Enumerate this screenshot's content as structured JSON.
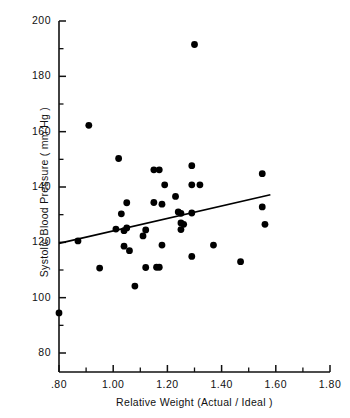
{
  "chart_data": {
    "type": "scatter",
    "title": "",
    "xlabel": "Relative Weight (Actual / Ideal )",
    "ylabel": "Systolic Blood Pressure ( mm Hg )",
    "xlim": [
      0.8,
      1.8
    ],
    "ylim": [
      75,
      200
    ],
    "grid": false,
    "legend": null,
    "x_major_ticks": [
      0.8,
      1.0,
      1.2,
      1.4,
      1.6,
      1.8
    ],
    "x_tick_labels": [
      ".80",
      "1.00",
      "1.20",
      "1.40",
      "1.60",
      "1.80"
    ],
    "x_minor_ticks": [
      0.9,
      1.1,
      1.3,
      1.5,
      1.7
    ],
    "y_major_ticks": [
      80,
      100,
      120,
      140,
      160,
      180,
      200
    ],
    "y_tick_labels": [
      "80",
      "100",
      "120",
      "140",
      "160",
      "180",
      "200"
    ],
    "y_minor_ticks": [
      90,
      110,
      130,
      150,
      170,
      190
    ],
    "marker": "filled-circle",
    "marker_color": "#000000",
    "marker_size": 3.4,
    "points": [
      {
        "x": 0.8,
        "y": 94.5
      },
      {
        "x": 0.87,
        "y": 120.5
      },
      {
        "x": 0.91,
        "y": 162.3
      },
      {
        "x": 0.95,
        "y": 110.7
      },
      {
        "x": 1.01,
        "y": 124.8
      },
      {
        "x": 1.02,
        "y": 150.3
      },
      {
        "x": 1.03,
        "y": 130.3
      },
      {
        "x": 1.04,
        "y": 124.2
      },
      {
        "x": 1.04,
        "y": 118.6
      },
      {
        "x": 1.05,
        "y": 125.2
      },
      {
        "x": 1.05,
        "y": 134.3
      },
      {
        "x": 1.06,
        "y": 117.0
      },
      {
        "x": 1.08,
        "y": 104.2
      },
      {
        "x": 1.11,
        "y": 122.3
      },
      {
        "x": 1.12,
        "y": 110.9
      },
      {
        "x": 1.12,
        "y": 124.5
      },
      {
        "x": 1.15,
        "y": 146.2
      },
      {
        "x": 1.15,
        "y": 134.4
      },
      {
        "x": 1.16,
        "y": 111.0
      },
      {
        "x": 1.17,
        "y": 111.0
      },
      {
        "x": 1.17,
        "y": 146.2
      },
      {
        "x": 1.18,
        "y": 119.0
      },
      {
        "x": 1.18,
        "y": 133.8
      },
      {
        "x": 1.19,
        "y": 140.8
      },
      {
        "x": 1.23,
        "y": 136.6
      },
      {
        "x": 1.24,
        "y": 131.0
      },
      {
        "x": 1.25,
        "y": 130.5
      },
      {
        "x": 1.25,
        "y": 127.0
      },
      {
        "x": 1.25,
        "y": 124.6
      },
      {
        "x": 1.26,
        "y": 126.5
      },
      {
        "x": 1.29,
        "y": 114.9
      },
      {
        "x": 1.29,
        "y": 130.6
      },
      {
        "x": 1.29,
        "y": 140.8
      },
      {
        "x": 1.29,
        "y": 147.7
      },
      {
        "x": 1.3,
        "y": 191.5
      },
      {
        "x": 1.32,
        "y": 140.8
      },
      {
        "x": 1.37,
        "y": 119.0
      },
      {
        "x": 1.47,
        "y": 113.0
      },
      {
        "x": 1.55,
        "y": 132.8
      },
      {
        "x": 1.55,
        "y": 144.8
      },
      {
        "x": 1.56,
        "y": 126.5
      }
    ],
    "regression_line": {
      "x_start": 0.8,
      "y_start": 119.6,
      "x_end": 1.58,
      "y_end": 137.2,
      "color": "#000000"
    }
  }
}
